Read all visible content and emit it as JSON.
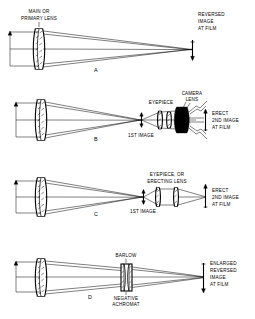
{
  "figure": {
    "background_color": "#ffffff",
    "ink_color": "#000000",
    "panel_count": 4
  },
  "panels": [
    {
      "id": "A",
      "letter": "A",
      "method": "prime-focus",
      "labels": {
        "primary_lens": "MAIN OR\nPRIMARY LENS",
        "primary_lens_line1": "MAIN OR",
        "primary_lens_line2": "PRIMARY LENS",
        "image": "REVERSED\nIMAGE\nAT FILM",
        "image_line1": "REVERSED",
        "image_line2": "IMAGE",
        "image_line3": "AT FILM"
      },
      "elements": [
        "objective-doublet",
        "film-plane"
      ],
      "image_orientation": "reversed"
    },
    {
      "id": "B",
      "letter": "B",
      "method": "afocal-with-camera-lens",
      "labels": {
        "first_image": "1ST IMAGE",
        "eyepiece": "EYEPIECE",
        "camera_lens_line1": "CAMERA",
        "camera_lens_line2": "LENS",
        "image_line1": "ERECT",
        "image_line2": "2ND IMAGE",
        "image_line3": "AT FILM"
      },
      "elements": [
        "objective-doublet",
        "first-image-arrow",
        "eyepiece-group",
        "camera-lens-stack",
        "film-plane"
      ],
      "image_orientation": "erect"
    },
    {
      "id": "C",
      "letter": "C",
      "method": "eyepiece-projection",
      "labels": {
        "first_image": "1ST IMAGE",
        "eyepiece_line1": "EYEPIECE, OR",
        "eyepiece_line2": "ERECTING LENS",
        "image_line1": "ERECT",
        "image_line2": "2ND IMAGE",
        "image_line3": "AT FILM"
      },
      "elements": [
        "objective-doublet",
        "first-image-arrow",
        "eyepiece-erecting-group",
        "film-plane"
      ],
      "image_orientation": "erect"
    },
    {
      "id": "D",
      "letter": "D",
      "method": "barlow-amplification",
      "labels": {
        "barlow": "BARLOW",
        "negative_line1": "NEGATIVE",
        "negative_line2": "ACHROMAT",
        "image_line1": "ENLARGED",
        "image_line2": "REVERSED",
        "image_line3": "IMAGE",
        "image_line4": "AT FILM"
      },
      "elements": [
        "objective-doublet",
        "barlow-negative-element",
        "film-plane"
      ],
      "image_orientation": "reversed-enlarged"
    }
  ]
}
